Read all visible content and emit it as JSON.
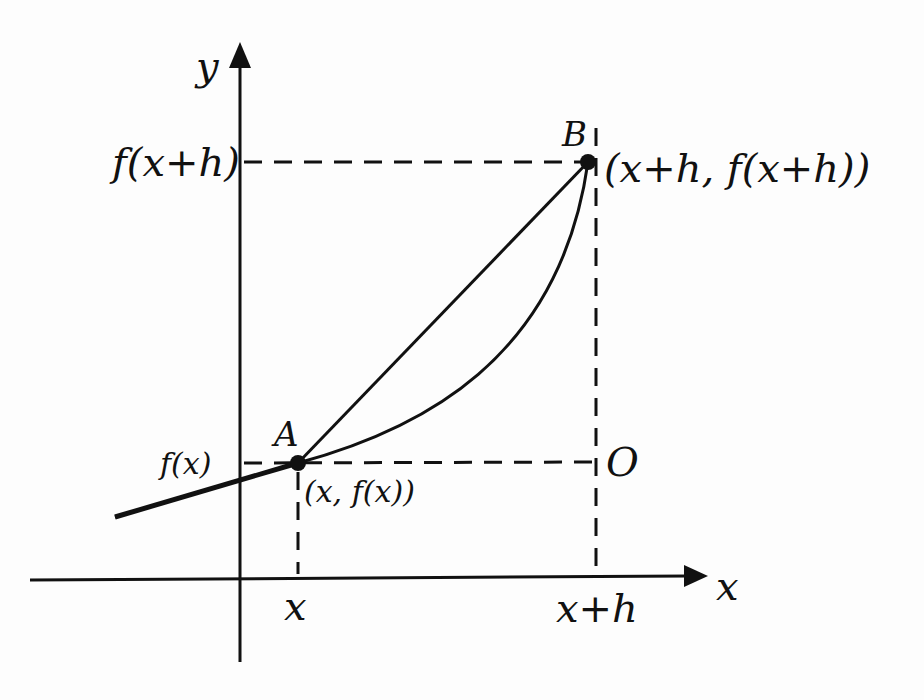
{
  "diagram": {
    "axes": {
      "x_label": "x",
      "y_label": "y"
    },
    "ticks": {
      "x_ticks": [
        "x",
        "x+h"
      ],
      "y_ticks": [
        "f(x)",
        "f(x+h)"
      ]
    },
    "points": [
      {
        "name": "A",
        "coords_label": "(x, f(x))"
      },
      {
        "name": "B",
        "coords_label": "(x+h, f(x+h))"
      },
      {
        "name": "O",
        "coords_label": ""
      }
    ],
    "elements": {
      "curve": "f(x)",
      "secant": "AB",
      "guides": [
        "horizontal dashed at f(x+h)",
        "horizontal dashed at f(x)",
        "vertical dashed at x",
        "vertical dashed at x+h"
      ]
    },
    "colors": {
      "ink": "#111111",
      "paper": "#fdfdfd"
    }
  }
}
